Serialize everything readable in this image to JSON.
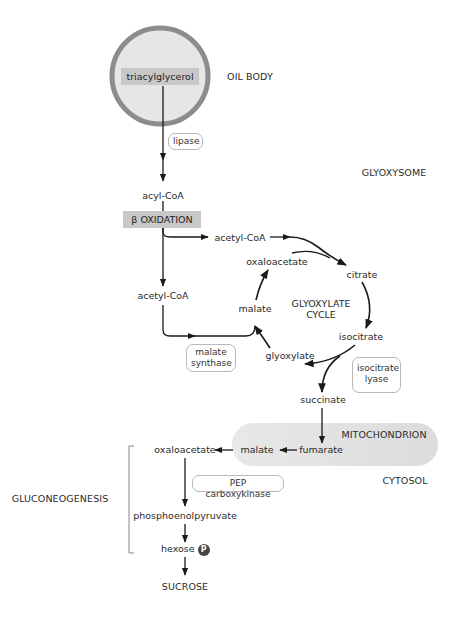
{
  "compartments": {
    "oil_body": "OIL BODY",
    "glyoxysome": "GLYOXYSOME",
    "mitochondrion": "MITOCHONDRION",
    "cytosol": "CYTOSOL"
  },
  "process_labels": {
    "beta_oxidation": "β OXIDATION",
    "glyoxylate_cycle_line1": "GLYOXYLATE",
    "glyoxylate_cycle_line2": "CYCLE",
    "gluconeogenesis": "GLUCONEOGENESIS"
  },
  "metabolites": {
    "triacylglycerol": "triacylglycerol",
    "acyl_coa": "acyl-CoA",
    "acetyl_coa_1": "acetyl-CoA",
    "acetyl_coa_2": "acetyl-CoA",
    "oxaloacetate_cycle": "oxaloacetate",
    "citrate": "citrate",
    "isocitrate": "isocitrate",
    "malate_cycle": "malate",
    "glyoxylate": "glyoxylate",
    "succinate": "succinate",
    "fumarate": "fumarate",
    "malate_cytosol": "malate",
    "oxaloacetate_cytosol": "oxaloacetate",
    "phosphoenolpyruvate": "phosphoenolpyruvate",
    "hexose": "hexose",
    "phosphate_badge": "P",
    "sucrose": "SUCROSE"
  },
  "enzymes": {
    "lipase": "lipase",
    "malate_synthase_line1": "malate",
    "malate_synthase_line2": "synthase",
    "isocitrate_lyase_line1": "isocitrate",
    "isocitrate_lyase_line2": "lyase",
    "pep_carboxykinase": "PEP carboxykinase"
  },
  "colors": {
    "oil_body_fill": "#e6e6e6",
    "oil_body_ring": "#8c8c8c",
    "gray_box": "#c8c8c8",
    "mitochondrion_fill": "#e2e2e2",
    "line": "#1a1a1a",
    "enzyme_border": "#b8b8b8"
  }
}
